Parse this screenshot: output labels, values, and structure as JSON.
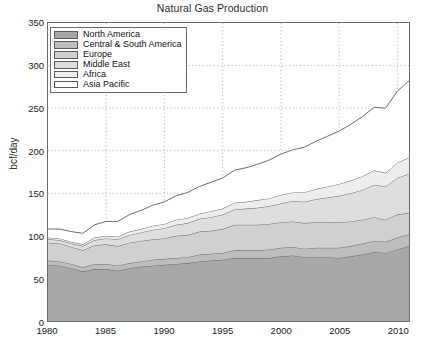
{
  "chart_data": {
    "type": "area",
    "stacked": true,
    "title": "Natural Gas Production",
    "xlabel": "",
    "ylabel": "bcf/day",
    "xlim": [
      1980,
      2011
    ],
    "ylim": [
      0,
      350
    ],
    "yticks": [
      0,
      50,
      100,
      150,
      200,
      250,
      300,
      350
    ],
    "xticks": [
      1980,
      1985,
      1990,
      1995,
      2000,
      2005,
      2010
    ],
    "grid": true,
    "grid_style": "dotted",
    "legend_position": "upper-left",
    "x": [
      1980,
      1981,
      1982,
      1983,
      1984,
      1985,
      1986,
      1987,
      1988,
      1989,
      1990,
      1991,
      1992,
      1993,
      1994,
      1995,
      1996,
      1997,
      1998,
      1999,
      2000,
      2001,
      2002,
      2003,
      2004,
      2005,
      2006,
      2007,
      2008,
      2009,
      2010,
      2011
    ],
    "series": [
      {
        "name": "North America",
        "color": "#a8a8a8",
        "values": [
          66,
          65,
          62,
          58,
          61,
          61,
          59,
          62,
          64,
          65,
          66,
          67,
          68,
          70,
          71,
          72,
          74,
          74,
          74,
          74,
          76,
          77,
          75,
          75,
          75,
          74,
          76,
          78,
          81,
          80,
          84,
          88
        ]
      },
      {
        "name": "Central & South America",
        "color": "#bdbdbd",
        "values": [
          5,
          5,
          5,
          5,
          6,
          6,
          6,
          6,
          6,
          7,
          7,
          7,
          7,
          8,
          8,
          8,
          9,
          9,
          9,
          10,
          10,
          10,
          10,
          11,
          11,
          12,
          12,
          13,
          13,
          13,
          14,
          14
        ]
      },
      {
        "name": "Europe",
        "color": "#d0d0d0",
        "values": [
          21,
          21,
          20,
          20,
          22,
          23,
          23,
          24,
          24,
          24,
          24,
          26,
          26,
          27,
          27,
          28,
          30,
          30,
          30,
          30,
          30,
          30,
          30,
          30,
          30,
          30,
          29,
          28,
          28,
          26,
          27,
          25
        ]
      },
      {
        "name": "Middle East",
        "color": "#dedede",
        "values": [
          4,
          4,
          4,
          5,
          6,
          7,
          8,
          9,
          10,
          11,
          12,
          13,
          14,
          15,
          16,
          17,
          18,
          19,
          20,
          21,
          22,
          24,
          25,
          27,
          29,
          31,
          33,
          35,
          38,
          39,
          43,
          46
        ]
      },
      {
        "name": "Africa",
        "color": "#ededed",
        "values": [
          2,
          2,
          2,
          2,
          3,
          3,
          3,
          4,
          4,
          5,
          5,
          6,
          6,
          6,
          7,
          7,
          8,
          8,
          9,
          9,
          10,
          10,
          11,
          12,
          13,
          14,
          15,
          16,
          17,
          16,
          18,
          19
        ]
      },
      {
        "name": "Asia Pacific",
        "color": "#ffffff",
        "values": [
          10,
          11,
          12,
          13,
          15,
          17,
          18,
          20,
          22,
          24,
          26,
          28,
          30,
          32,
          34,
          36,
          38,
          40,
          42,
          45,
          48,
          50,
          53,
          56,
          59,
          62,
          66,
          70,
          74,
          76,
          84,
          90
        ]
      }
    ],
    "totals": [
      108,
      108,
      105,
      103,
      113,
      117,
      117,
      125,
      130,
      136,
      140,
      147,
      151,
      158,
      163,
      168,
      177,
      180,
      184,
      189,
      196,
      201,
      204,
      211,
      217,
      223,
      231,
      240,
      251,
      250,
      270,
      282
    ]
  },
  "axes": {
    "ytick_labels": [
      "0",
      "50",
      "100",
      "150",
      "200",
      "250",
      "300",
      "350"
    ],
    "xtick_labels": [
      "1980",
      "1985",
      "1990",
      "1995",
      "2000",
      "2005",
      "2010"
    ],
    "ylabel": "bcf/day"
  },
  "legend": {
    "items": [
      {
        "label": "North America",
        "color": "#a8a8a8"
      },
      {
        "label": "Central & South America",
        "color": "#bdbdbd"
      },
      {
        "label": "Europe",
        "color": "#d0d0d0"
      },
      {
        "label": "Middle East",
        "color": "#dedede"
      },
      {
        "label": "Africa",
        "color": "#ededed"
      },
      {
        "label": "Asia Pacific",
        "color": "#ffffff"
      }
    ]
  },
  "style": {
    "axis_color": "#6e6e6e",
    "grid_color": "#9a9a9a",
    "line_color": "#5c5c5c",
    "text_color": "#1a1a1a"
  }
}
